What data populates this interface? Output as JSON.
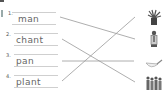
{
  "exercise": {
    "items": [
      {
        "number": "1.",
        "word": "man"
      },
      {
        "number": "2.",
        "word": "chant"
      },
      {
        "number": "3.",
        "word": "pan"
      },
      {
        "number": "4.",
        "word": "plant"
      }
    ],
    "pictures": [
      {
        "icon": "potted-plant-icon"
      },
      {
        "icon": "man-icon"
      },
      {
        "icon": "pan-icon"
      },
      {
        "icon": "chanting-crowd-icon"
      }
    ],
    "matches": [
      {
        "from": "man",
        "to": "man-icon"
      },
      {
        "from": "chant",
        "to": "chanting-crowd-icon"
      },
      {
        "from": "pan",
        "to": "pan-icon"
      },
      {
        "from": "plant",
        "to": "potted-plant-icon"
      }
    ]
  }
}
